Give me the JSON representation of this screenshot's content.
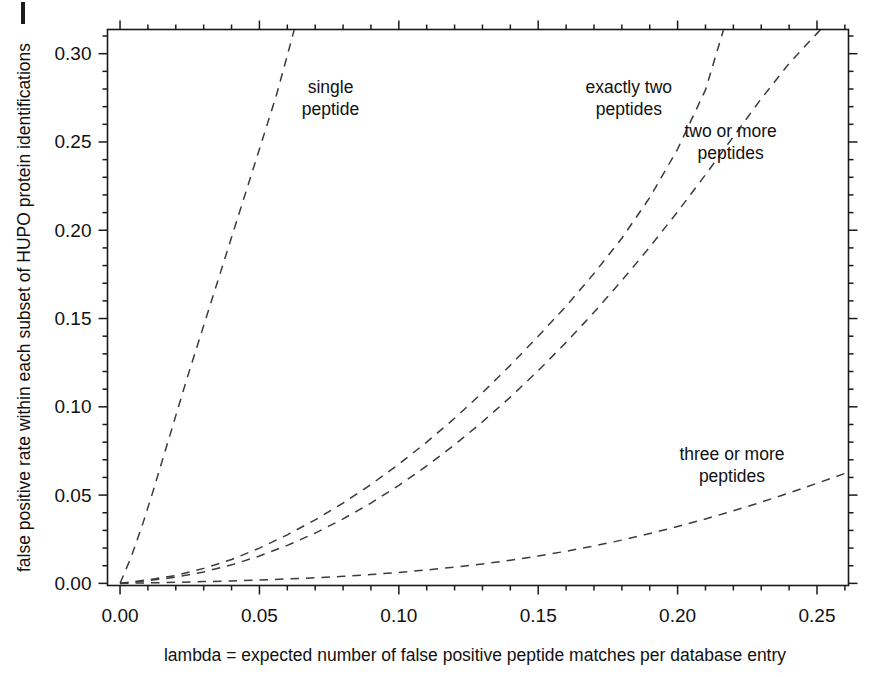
{
  "chart_data": {
    "type": "line",
    "title": "",
    "xlabel": "lambda  =  expected number of false positive peptide matches per database entry",
    "ylabel": "false positive rate within each subset of HUPO protein identifications",
    "xlim": [
      -0.0045,
      0.2613
    ],
    "ylim": [
      -0.0012,
      0.3137
    ],
    "xticks": [
      0.0,
      0.05,
      0.1,
      0.15,
      0.2,
      0.25
    ],
    "xtick_labels": [
      "0.00",
      "0.05",
      "0.10",
      "0.15",
      "0.20",
      "0.25"
    ],
    "yticks": [
      0.0,
      0.05,
      0.1,
      0.15,
      0.2,
      0.25,
      0.3
    ],
    "ytick_labels": [
      "0.00",
      "0.05",
      "0.10",
      "0.15",
      "0.20",
      "0.25",
      "0.30"
    ],
    "minor_ticks_per_interval": 5,
    "grid": false,
    "legend": "inline-annotations",
    "line_style": "dashed",
    "line_color": "#3b3b3b",
    "frame_color": "#1a1a1a",
    "background": "#ffffff",
    "series": [
      {
        "name": "single peptide",
        "label": "single\npeptide",
        "label_lines": [
          "single",
          "peptide"
        ],
        "label_x": 0.0755,
        "label_y": 0.2775,
        "x": [
          0.0,
          0.004,
          0.008,
          0.012,
          0.016,
          0.02,
          0.024,
          0.028,
          0.032,
          0.036,
          0.04,
          0.044,
          0.048,
          0.052,
          0.056,
          0.06,
          0.0625
        ],
        "y": [
          0.0,
          0.015,
          0.033,
          0.053,
          0.074,
          0.095,
          0.116,
          0.136,
          0.156,
          0.176,
          0.196,
          0.216,
          0.236,
          0.256,
          0.276,
          0.299,
          0.3137
        ]
      },
      {
        "name": "exactly two peptides",
        "label": "exactly two\npeptides",
        "label_lines": [
          "exactly two",
          "peptides"
        ],
        "label_x": 0.1825,
        "label_y": 0.2775,
        "x": [
          0.0,
          0.01,
          0.02,
          0.03,
          0.04,
          0.05,
          0.06,
          0.07,
          0.08,
          0.09,
          0.1,
          0.11,
          0.12,
          0.13,
          0.14,
          0.15,
          0.16,
          0.17,
          0.18,
          0.19,
          0.2,
          0.21,
          0.2165
        ],
        "y": [
          0.0,
          0.002,
          0.0045,
          0.0085,
          0.0135,
          0.02,
          0.0275,
          0.036,
          0.0455,
          0.056,
          0.0675,
          0.08,
          0.0935,
          0.108,
          0.1235,
          0.14,
          0.157,
          0.1755,
          0.1955,
          0.2185,
          0.246,
          0.2795,
          0.3137
        ]
      },
      {
        "name": "two or more peptides",
        "label": "two or more\npeptides",
        "label_lines": [
          "two or more",
          "peptides"
        ],
        "label_x": 0.219,
        "label_y": 0.253,
        "x": [
          0.0,
          0.01,
          0.02,
          0.03,
          0.04,
          0.05,
          0.06,
          0.07,
          0.08,
          0.09,
          0.1,
          0.11,
          0.12,
          0.13,
          0.14,
          0.15,
          0.16,
          0.17,
          0.18,
          0.19,
          0.2,
          0.21,
          0.22,
          0.23,
          0.24,
          0.25,
          0.2613
        ],
        "y": [
          0.0,
          0.0015,
          0.0035,
          0.0065,
          0.0105,
          0.0155,
          0.0215,
          0.0285,
          0.0365,
          0.0455,
          0.0555,
          0.0665,
          0.0785,
          0.0915,
          0.1055,
          0.1205,
          0.1365,
          0.1535,
          0.1715,
          0.1905,
          0.2105,
          0.2315,
          0.253,
          0.2745,
          0.2945,
          0.3115,
          0.33
        ]
      },
      {
        "name": "three or more peptides",
        "label": "three or more\npeptides",
        "label_lines": [
          "three or more",
          "peptides"
        ],
        "label_x": 0.2195,
        "label_y": 0.07,
        "x": [
          0.0,
          0.01,
          0.02,
          0.03,
          0.04,
          0.05,
          0.06,
          0.07,
          0.08,
          0.09,
          0.1,
          0.11,
          0.12,
          0.13,
          0.14,
          0.15,
          0.16,
          0.17,
          0.18,
          0.19,
          0.2,
          0.21,
          0.22,
          0.23,
          0.24,
          0.25,
          0.2613
        ],
        "y": [
          0.0,
          0.0003,
          0.0006,
          0.001,
          0.0014,
          0.0019,
          0.0025,
          0.0032,
          0.004,
          0.005,
          0.0062,
          0.0076,
          0.0092,
          0.011,
          0.0131,
          0.0155,
          0.0182,
          0.0212,
          0.0245,
          0.0282,
          0.0322,
          0.0365,
          0.0411,
          0.046,
          0.0512,
          0.0567,
          0.063
        ]
      }
    ]
  }
}
